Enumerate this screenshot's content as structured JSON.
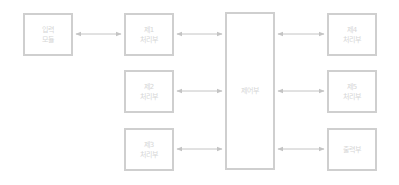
{
  "diagram": {
    "colors": {
      "border": "#cfcfcf",
      "text": "#d6d6d6",
      "arrow": "#c4c4c4"
    },
    "nodes": [
      {
        "id": "left",
        "label": "입력\n모듈",
        "x": 23,
        "y": 13,
        "w": 50,
        "h": 43
      },
      {
        "id": "col2_top",
        "label": "제1\n처리부",
        "x": 124,
        "y": 13,
        "w": 50,
        "h": 43
      },
      {
        "id": "col2_mid",
        "label": "제2\n처리부",
        "x": 124,
        "y": 70,
        "w": 50,
        "h": 43
      },
      {
        "id": "col2_bot",
        "label": "제3\n처리부",
        "x": 124,
        "y": 128,
        "w": 50,
        "h": 43
      },
      {
        "id": "center",
        "label": "제어부",
        "x": 225,
        "y": 12,
        "w": 50,
        "h": 158
      },
      {
        "id": "col4_top",
        "label": "제4\n처리부",
        "x": 327,
        "y": 13,
        "w": 50,
        "h": 43
      },
      {
        "id": "col4_mid",
        "label": "제5\n처리부",
        "x": 327,
        "y": 70,
        "w": 50,
        "h": 43
      },
      {
        "id": "col4_bot",
        "label": "출력부",
        "x": 327,
        "y": 128,
        "w": 50,
        "h": 43
      }
    ],
    "edges": [
      {
        "from": "left",
        "to": "col2_top",
        "type": "bidirectional"
      },
      {
        "from": "col2_top",
        "to": "center",
        "type": "bidirectional"
      },
      {
        "from": "col2_mid",
        "to": "center",
        "type": "bidirectional"
      },
      {
        "from": "col2_bot",
        "to": "center",
        "type": "bidirectional"
      },
      {
        "from": "center",
        "to": "col4_top",
        "type": "bidirectional"
      },
      {
        "from": "center",
        "to": "col4_mid",
        "type": "bidirectional"
      },
      {
        "from": "center",
        "to": "col4_bot",
        "type": "bidirectional"
      }
    ]
  }
}
